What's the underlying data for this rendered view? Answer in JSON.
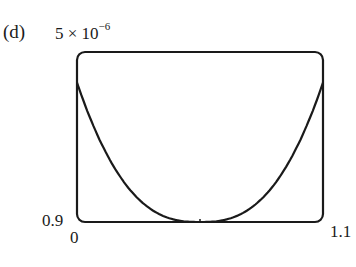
{
  "panel": {
    "label": "(d)"
  },
  "chart_data": {
    "type": "line",
    "title": "",
    "panel_label": "(d)",
    "xlabel": "",
    "ylabel": "",
    "xlim": [
      0.9,
      1.1
    ],
    "ylim": [
      0,
      5e-06
    ],
    "tick_labels": {
      "y_top": "5 × 10⁻⁶",
      "y_bottom": "0",
      "x_left": "0.9",
      "x_right": "1.1"
    },
    "grid": false,
    "legend": null,
    "series": [
      {
        "name": "curve",
        "x": [
          0.9,
          0.92,
          0.94,
          0.96,
          0.98,
          1.0,
          1.02,
          1.04,
          1.06,
          1.08,
          1.1
        ],
        "y": [
          4.1e-06,
          2.3e-06,
          1.15e-06,
          4.2e-07,
          7e-08,
          0,
          7e-08,
          4.2e-07,
          1.15e-06,
          2.3e-06,
          4.1e-06
        ]
      }
    ]
  },
  "labels": {
    "ymax_base": "5 × 10",
    "ymax_exp": "−6",
    "ymin": "0.9",
    "xmin": "0",
    "xmax": "1.1"
  }
}
